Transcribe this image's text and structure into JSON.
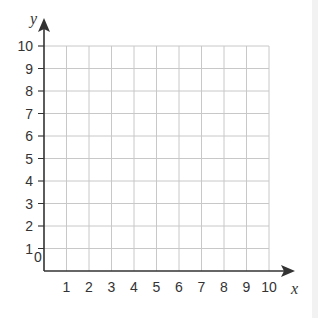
{
  "chart_data": {
    "type": "scatter",
    "title": "",
    "xlabel": "x",
    "ylabel": "y",
    "xlim": [
      0,
      10
    ],
    "ylim": [
      0,
      10
    ],
    "x_ticks": [
      "1",
      "2",
      "3",
      "4",
      "5",
      "6",
      "7",
      "8",
      "9",
      "10"
    ],
    "y_ticks": [
      "1",
      "2",
      "3",
      "4",
      "5",
      "6",
      "7",
      "8",
      "9",
      "10"
    ],
    "origin_label": "0",
    "grid": true,
    "series": [],
    "colors": {
      "grid": "#c8c8c8",
      "axis": "#333333"
    }
  }
}
